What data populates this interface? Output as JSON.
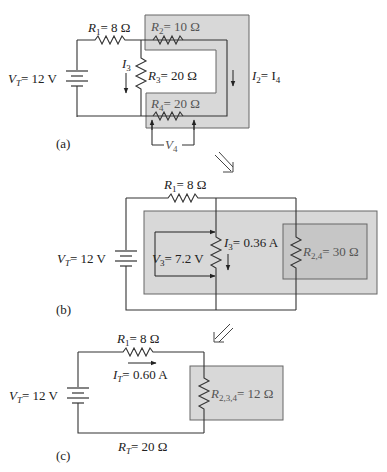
{
  "figure": {
    "parts": [
      {
        "id": "a",
        "label": "(a)",
        "source": {
          "name": "V",
          "sub": "T",
          "value": "= 12 V"
        },
        "resistors": [
          {
            "name": "R",
            "sub": "1",
            "value": "= 8 Ω"
          },
          {
            "name": "R",
            "sub": "2",
            "value": "= 10 Ω"
          },
          {
            "name": "R",
            "sub": "3",
            "value": "= 20 Ω"
          },
          {
            "name": "R",
            "sub": "4",
            "value": "= 20 Ω"
          }
        ],
        "currents": [
          {
            "name": "I",
            "sub": "3",
            "value": ""
          },
          {
            "name": "I",
            "sub": "2",
            "value": "= I",
            "sub2": "4"
          }
        ],
        "voltages": [
          {
            "name": "V",
            "sub": "4"
          }
        ]
      },
      {
        "id": "b",
        "label": "(b)",
        "source": {
          "name": "V",
          "sub": "T",
          "value": "= 12 V"
        },
        "resistors": [
          {
            "name": "R",
            "sub": "1",
            "value": "= 8 Ω"
          },
          {
            "name": "R",
            "sub": "2,4",
            "value": "= 30 Ω"
          }
        ],
        "currents": [
          {
            "name": "I",
            "sub": "3",
            "value": "= 0.36 A"
          }
        ],
        "voltages": [
          {
            "name": "V",
            "sub": "3",
            "value": "= 7.2 V"
          }
        ]
      },
      {
        "id": "c",
        "label": "(c)",
        "source": {
          "name": "V",
          "sub": "T",
          "value": "= 12 V"
        },
        "resistors": [
          {
            "name": "R",
            "sub": "1",
            "value": "= 8 Ω"
          },
          {
            "name": "R",
            "sub": "2,3,4",
            "value": "= 12 Ω"
          }
        ],
        "currents": [
          {
            "name": "I",
            "sub": "T",
            "value": "= 0.60 A"
          }
        ],
        "totals": [
          {
            "name": "R",
            "sub": "T",
            "value": "= 20 Ω"
          }
        ]
      }
    ],
    "arrows": [
      {
        "direction": "down-right"
      },
      {
        "direction": "down-left"
      }
    ]
  }
}
